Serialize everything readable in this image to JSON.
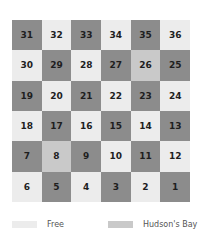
{
  "colors": {
    "dark": "#8c8c8c",
    "free": "#ececec",
    "hudsons_bay": "#c9c9c9",
    "text": "#1e1e1e"
  },
  "grid": {
    "rows": [
      [
        {
          "number": "31",
          "shade": "dark"
        },
        {
          "number": "32",
          "shade": "light"
        },
        {
          "number": "33",
          "shade": "dark"
        },
        {
          "number": "34",
          "shade": "light"
        },
        {
          "number": "35",
          "shade": "dark"
        },
        {
          "number": "36",
          "shade": "light"
        }
      ],
      [
        {
          "number": "30",
          "shade": "light"
        },
        {
          "number": "29",
          "shade": "dark"
        },
        {
          "number": "28",
          "shade": "light"
        },
        {
          "number": "27",
          "shade": "dark"
        },
        {
          "number": "26",
          "shade": "medium"
        },
        {
          "number": "25",
          "shade": "dark"
        }
      ],
      [
        {
          "number": "19",
          "shade": "dark"
        },
        {
          "number": "20",
          "shade": "light"
        },
        {
          "number": "21",
          "shade": "dark"
        },
        {
          "number": "22",
          "shade": "light"
        },
        {
          "number": "23",
          "shade": "dark"
        },
        {
          "number": "24",
          "shade": "light"
        }
      ],
      [
        {
          "number": "18",
          "shade": "light"
        },
        {
          "number": "17",
          "shade": "dark"
        },
        {
          "number": "16",
          "shade": "light"
        },
        {
          "number": "15",
          "shade": "dark"
        },
        {
          "number": "14",
          "shade": "light"
        },
        {
          "number": "13",
          "shade": "dark"
        }
      ],
      [
        {
          "number": "7",
          "shade": "dark"
        },
        {
          "number": "8",
          "shade": "medium"
        },
        {
          "number": "9",
          "shade": "dark"
        },
        {
          "number": "10",
          "shade": "light"
        },
        {
          "number": "11",
          "shade": "dark"
        },
        {
          "number": "12",
          "shade": "light"
        }
      ],
      [
        {
          "number": "6",
          "shade": "light"
        },
        {
          "number": "5",
          "shade": "dark"
        },
        {
          "number": "4",
          "shade": "light"
        },
        {
          "number": "3",
          "shade": "dark"
        },
        {
          "number": "2",
          "shade": "light"
        },
        {
          "number": "1",
          "shade": "dark"
        }
      ]
    ]
  },
  "legend": {
    "items": [
      {
        "label": "Free",
        "shade": "light"
      },
      {
        "label": "Hudson's Bay",
        "shade": "medium"
      }
    ]
  }
}
